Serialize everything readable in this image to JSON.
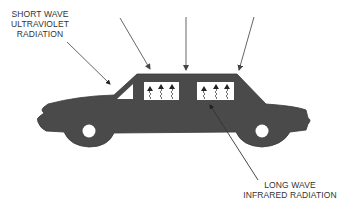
{
  "diagram": {
    "labels": {
      "short_wave": {
        "lines": [
          "SHORT WAVE",
          "ULTRAVIOLET",
          "RADIATION"
        ]
      },
      "long_wave": {
        "lines": [
          "LONG WAVE",
          "INFRARED RADIATION"
        ]
      }
    },
    "colors": {
      "car_body": "#4a4a4a",
      "window": "#ffffff",
      "arrow": "#555555",
      "text": "#333333"
    },
    "incoming_rays": 3,
    "window_heat_arrows": 6
  }
}
